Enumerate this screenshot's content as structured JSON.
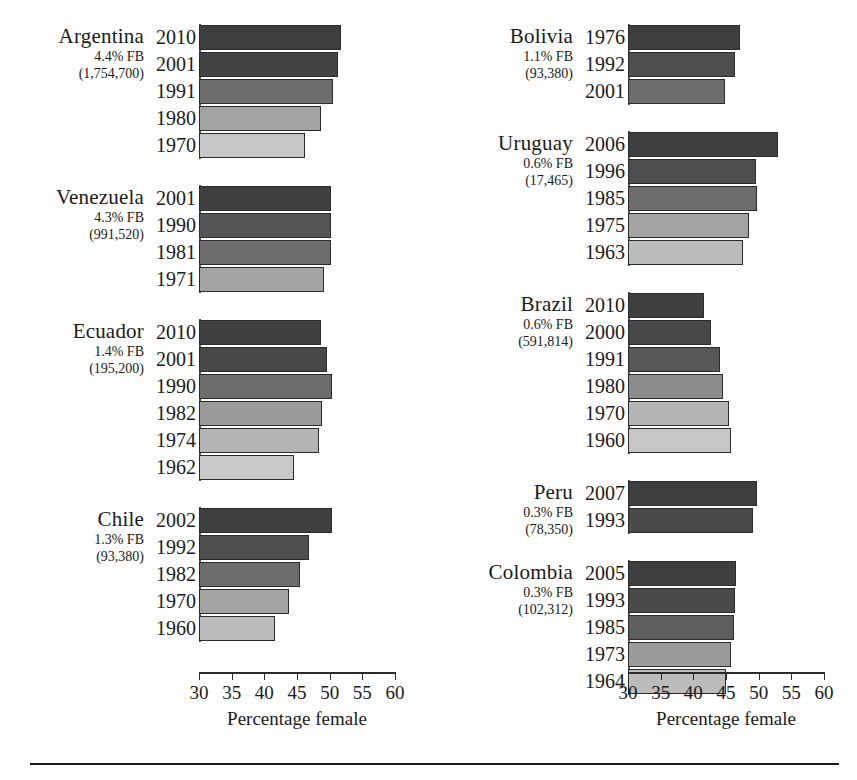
{
  "figure": {
    "axis_title": "Percentage female",
    "tick_labels": [
      "30",
      "35",
      "40",
      "45",
      "50",
      "55",
      "60"
    ],
    "fb_suffix": "% FB"
  },
  "chart_data": {
    "type": "bar",
    "orientation": "horizontal",
    "title": "",
    "xlabel": "Percentage female",
    "ylabel": "",
    "xlim": [
      30,
      60
    ],
    "xticks": [
      30,
      35,
      40,
      45,
      50,
      55,
      60
    ],
    "grid": false,
    "legend": "none",
    "note": "Each country panel shows percentage female among the foreign-born by census year. Bar shading goes from dark (most recent) to light (earliest).",
    "panels": [
      {
        "side": "left",
        "groups": [
          {
            "country": "Argentina",
            "fb_percent": "4.4% FB",
            "fb_count": "(1,754,700)",
            "categories": [
              "2010",
              "2001",
              "1991",
              "1980",
              "1970"
            ],
            "values": [
              51.7,
              51.2,
              50.5,
              48.7,
              46.3
            ],
            "shades": [
              "#3f3f3f",
              "#434343",
              "#6d6d6d",
              "#a3a3a3",
              "#c6c6c6"
            ]
          },
          {
            "country": "Venezuela",
            "fb_percent": "4.3% FB",
            "fb_count": "(991,520)",
            "categories": [
              "2001",
              "1990",
              "1981",
              "1971"
            ],
            "values": [
              50.2,
              50.2,
              50.2,
              49.1
            ],
            "shades": [
              "#3f3f3f",
              "#555555",
              "#6d6d6d",
              "#a3a3a3"
            ]
          },
          {
            "country": "Ecuador",
            "fb_percent": "1.4% FB",
            "fb_count": "(195,200)",
            "categories": [
              "2010",
              "2001",
              "1990",
              "1982",
              "1974",
              "1962"
            ],
            "values": [
              48.6,
              49.6,
              50.4,
              48.8,
              48.4,
              44.6
            ],
            "shades": [
              "#3f3f3f",
              "#484848",
              "#6d6d6d",
              "#9b9b9b",
              "#b4b4b4",
              "#c9c9c9"
            ]
          },
          {
            "country": "Chile",
            "fb_percent": "1.3% FB",
            "fb_count": "(93,380)",
            "categories": [
              "2002",
              "1992",
              "1982",
              "1970",
              "1960"
            ],
            "values": [
              50.4,
              46.9,
              45.5,
              43.8,
              41.6
            ],
            "shades": [
              "#3f3f3f",
              "#4e4e4e",
              "#6d6d6d",
              "#a3a3a3",
              "#bcbcbc"
            ]
          }
        ]
      },
      {
        "side": "right",
        "groups": [
          {
            "country": "Bolivia",
            "fb_percent": "1.1% FB",
            "fb_count": "(93,380)",
            "categories": [
              "1976",
              "1992",
              "2001"
            ],
            "values": [
              47.1,
              46.4,
              44.8
            ],
            "shades": [
              "#3f3f3f",
              "#4e4e4e",
              "#6d6d6d"
            ]
          },
          {
            "country": "Uruguay",
            "fb_percent": "0.6% FB",
            "fb_count": "(17,465)",
            "categories": [
              "2006",
              "1996",
              "1985",
              "1975",
              "1963"
            ],
            "values": [
              52.9,
              49.6,
              49.7,
              48.5,
              47.6
            ],
            "shades": [
              "#3f3f3f",
              "#4e4e4e",
              "#6d6d6d",
              "#a3a3a3",
              "#bcbcbc"
            ]
          },
          {
            "country": "Brazil",
            "fb_percent": "0.6% FB",
            "fb_count": "(591,814)",
            "categories": [
              "2010",
              "2000",
              "1991",
              "1980",
              "1970",
              "1960"
            ],
            "values": [
              41.7,
              42.7,
              44.1,
              44.6,
              45.4,
              45.8
            ],
            "shades": [
              "#3f3f3f",
              "#484848",
              "#575757",
              "#8d8d8d",
              "#b4b4b4",
              "#c6c6c6"
            ]
          },
          {
            "country": "Peru",
            "fb_percent": "0.3% FB",
            "fb_count": "(78,350)",
            "categories": [
              "2007",
              "1993"
            ],
            "values": [
              49.7,
              49.2
            ],
            "shades": [
              "#3f3f3f",
              "#4a4a4a"
            ]
          },
          {
            "country": "Colombia",
            "fb_percent": "0.3% FB",
            "fb_count": "(102,312)",
            "categories": [
              "2005",
              "1993",
              "1985",
              "1973",
              "1964"
            ],
            "values": [
              46.6,
              46.4,
              46.2,
              45.8,
              45.0
            ],
            "shades": [
              "#3f3f3f",
              "#4a4a4a",
              "#5e5e5e",
              "#9b9b9b",
              "#bcbcbc"
            ]
          }
        ]
      }
    ]
  }
}
